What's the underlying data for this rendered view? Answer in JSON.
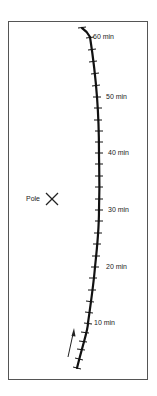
{
  "diagram": {
    "pole": {
      "label": "Pole",
      "marker": "x-mark"
    },
    "track": {
      "tick_interval_min": 2,
      "start_min": 0,
      "end_min": 62,
      "labels": [
        {
          "minutes": 10,
          "text": "10 min"
        },
        {
          "minutes": 20,
          "text": "20 min"
        },
        {
          "minutes": 30,
          "text": "30 min"
        },
        {
          "minutes": 40,
          "text": "40 min"
        },
        {
          "minutes": 50,
          "text": "50 min"
        },
        {
          "minutes": 60,
          "text": "60 min"
        }
      ],
      "direction_arrow": "up"
    },
    "colors": {
      "track": "#111111",
      "frame": "#555555",
      "text": "#222222"
    }
  }
}
